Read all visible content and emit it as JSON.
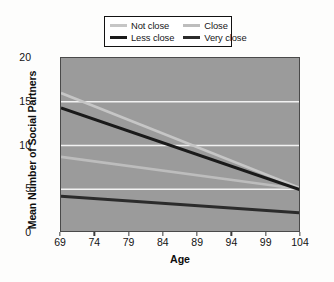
{
  "chart_data": {
    "type": "line",
    "title": "",
    "xlabel": "Age",
    "ylabel": "Mean Number of Social Partners",
    "xlim": [
      69,
      104
    ],
    "ylim": [
      0,
      20
    ],
    "xticks": [
      69,
      74,
      79,
      84,
      89,
      94,
      99,
      104
    ],
    "yticks": [
      0,
      5,
      10,
      15,
      20
    ],
    "grid": true,
    "gridlines_at": [
      5,
      10,
      15
    ],
    "legend_position": "top-center",
    "plot_background": "#9b9b9b",
    "gridline_color": "#f2f2f2",
    "series": [
      {
        "name": "Not close",
        "color": "#c6c6c6",
        "width": 2.6,
        "x": [
          69,
          104
        ],
        "values": [
          16.0,
          5.1
        ]
      },
      {
        "name": "Close",
        "color": "#bdbdbd",
        "width": 2.6,
        "x": [
          69,
          104
        ],
        "values": [
          8.7,
          5.0
        ]
      },
      {
        "name": "Less close",
        "color": "#1a1a1a",
        "width": 3.0,
        "x": [
          69,
          104
        ],
        "values": [
          14.3,
          4.9
        ]
      },
      {
        "name": "Very close",
        "color": "#2b2b2b",
        "width": 3.0,
        "x": [
          69,
          104
        ],
        "values": [
          4.2,
          2.3
        ]
      }
    ]
  },
  "legend": {
    "entries": [
      {
        "label": "Not close",
        "swatch_color": "#c6c6c6",
        "swatch_thickness": 3
      },
      {
        "label": "Close",
        "swatch_color": "#bdbdbd",
        "swatch_thickness": 3
      },
      {
        "label": "Less close",
        "swatch_color": "#1a1a1a",
        "swatch_thickness": 3.4
      },
      {
        "label": "Very close",
        "swatch_color": "#2b2b2b",
        "swatch_thickness": 3.4
      }
    ]
  },
  "axes": {
    "x_label": "Age",
    "y_label": "Mean Number of Social Partners",
    "x_tick_labels": [
      "69",
      "74",
      "79",
      "84",
      "89",
      "94",
      "99",
      "104"
    ],
    "y_tick_labels": [
      "0",
      "5",
      "10",
      "15",
      "20"
    ]
  }
}
